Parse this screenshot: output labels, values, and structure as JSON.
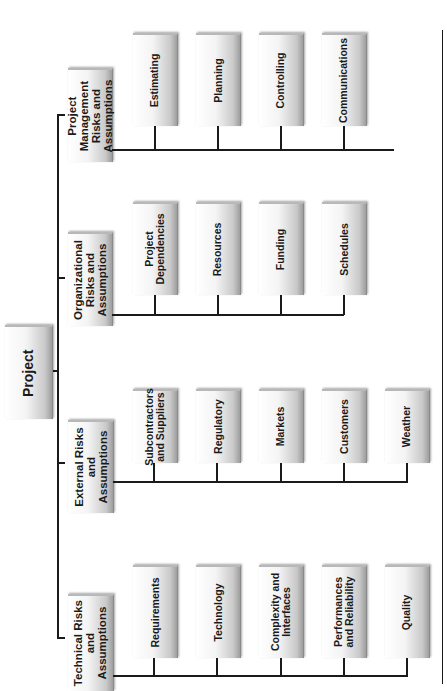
{
  "root": {
    "label": "Project"
  },
  "categories": [
    {
      "label": "Project\nManagement\nRisks and\nAssumptions",
      "children": [
        "Estimating",
        "Planning",
        "Controlling",
        "Communications"
      ]
    },
    {
      "label": "Organizational\nRisks and\nAssumptions",
      "children": [
        "Project\nDependencies",
        "Resources",
        "Funding",
        "Schedules"
      ]
    },
    {
      "label": "External Risks\nand\nAssumptions",
      "children": [
        "Subcontractors\nand Suppliers",
        "Regulatory",
        "Markets",
        "Customers",
        "Weather"
      ]
    },
    {
      "label": "Technical Risks\nand\nAssumptions",
      "children": [
        "Requirements",
        "Technology",
        "Complexity and\nInterfaces",
        "Performances\nand Reliability",
        "Quality"
      ]
    }
  ],
  "colors": {
    "line": "#1a1a1a",
    "box_light": "#ffffff",
    "box_dark": "#9e9e9e"
  }
}
